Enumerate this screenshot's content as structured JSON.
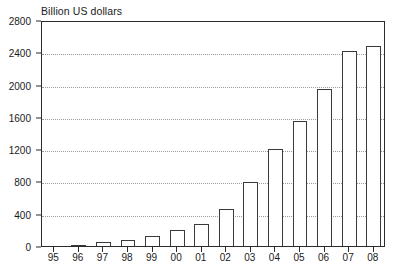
{
  "chart_data": {
    "type": "bar",
    "title": "Billion US dollars",
    "xlabel": "",
    "ylabel": "",
    "categories": [
      "95",
      "96",
      "97",
      "98",
      "99",
      "00",
      "01",
      "02",
      "03",
      "04",
      "05",
      "06",
      "07",
      "08"
    ],
    "values": [
      0,
      15,
      55,
      80,
      125,
      195,
      270,
      455,
      790,
      1200,
      1550,
      1950,
      2420,
      2480
    ],
    "ylim": [
      0,
      2800
    ],
    "yticks": [
      0,
      400,
      800,
      1200,
      1600,
      2000,
      2400,
      2800
    ],
    "ytick_labels": [
      "0",
      "400",
      "800",
      "1200",
      "1600",
      "2000",
      "2400",
      "2800"
    ],
    "grid": true,
    "grid_axis": "y",
    "legend": null,
    "bar_fill": "#ffffff",
    "bar_edge": "#3a3a3a",
    "axis_color": "#2b2b2b",
    "grid_color": "#9a9a9a"
  }
}
